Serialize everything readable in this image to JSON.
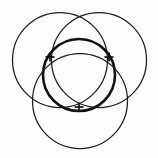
{
  "figure": {
    "title": "Three overlapping circles with inscribed bold circle",
    "type": "geometric-diagram",
    "canvas": {
      "width": 158,
      "height": 158,
      "background": "#fdfdfd"
    },
    "stroke_color": "#1b1b1b",
    "bold_stroke_color": "#111111"
  },
  "chart_data": {
    "type": "diagram",
    "title": "Three overlapping circles with inscribed bold circle",
    "elements": [
      {
        "name": "top-left-circle",
        "shape": "circle",
        "cx": 60,
        "cy": 60,
        "r": 47.5,
        "stroke_width": 1.25,
        "style": "thin"
      },
      {
        "name": "top-right-circle",
        "shape": "circle",
        "cx": 99,
        "cy": 60,
        "r": 47.5,
        "stroke_width": 1.25,
        "style": "thin"
      },
      {
        "name": "bottom-circle",
        "shape": "circle",
        "cx": 80,
        "cy": 101,
        "r": 47.5,
        "stroke_width": 1.25,
        "style": "thin"
      },
      {
        "name": "central-bold-circle",
        "shape": "circle",
        "cx": 79,
        "cy": 75,
        "r": 36,
        "stroke_width": 2.6,
        "style": "bold"
      }
    ],
    "tick_marks": [
      {
        "name": "tick-left",
        "x": 50,
        "y": 57,
        "size": 9
      },
      {
        "name": "tick-right",
        "x": 109,
        "y": 57,
        "size": 9
      },
      {
        "name": "tick-bottom",
        "x": 79,
        "y": 107,
        "size": 9
      }
    ]
  }
}
